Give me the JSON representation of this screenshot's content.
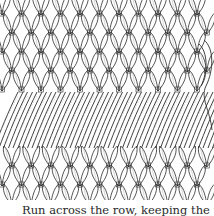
{
  "figure": {
    "colors": {
      "ink": "#2b2b2b",
      "paper": "#ffffff",
      "shading": "#9a9a9a"
    },
    "grid": {
      "columns": 11,
      "rows_top": 5,
      "rows_bottom": 3
    }
  },
  "caption": {
    "text": "Run across the row, keeping the tensi"
  }
}
